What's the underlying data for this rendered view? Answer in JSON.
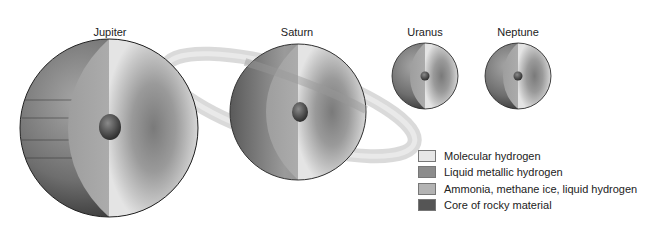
{
  "diagram": {
    "planets": [
      {
        "name": "Jupiter",
        "cx": 109,
        "cy": 128,
        "r": 89,
        "label_y": 25
      },
      {
        "name": "Saturn",
        "cx": 298,
        "cy": 112,
        "r": 68,
        "label_y": 25
      },
      {
        "name": "Uranus",
        "cx": 425,
        "cy": 76,
        "r": 33,
        "label_y": 25
      },
      {
        "name": "Neptune",
        "cx": 518,
        "cy": 76,
        "r": 33,
        "label_y": 25
      }
    ],
    "legend": [
      {
        "label": "Molecular hydrogen",
        "color": "#e6e6e6"
      },
      {
        "label": "Liquid metallic hydrogen",
        "color": "#8c8c8c"
      },
      {
        "label": "Ammonia, methane ice, liquid hydrogen",
        "color": "#b3b3b3"
      },
      {
        "label": "Core of rocky material",
        "color": "#555555"
      }
    ]
  }
}
